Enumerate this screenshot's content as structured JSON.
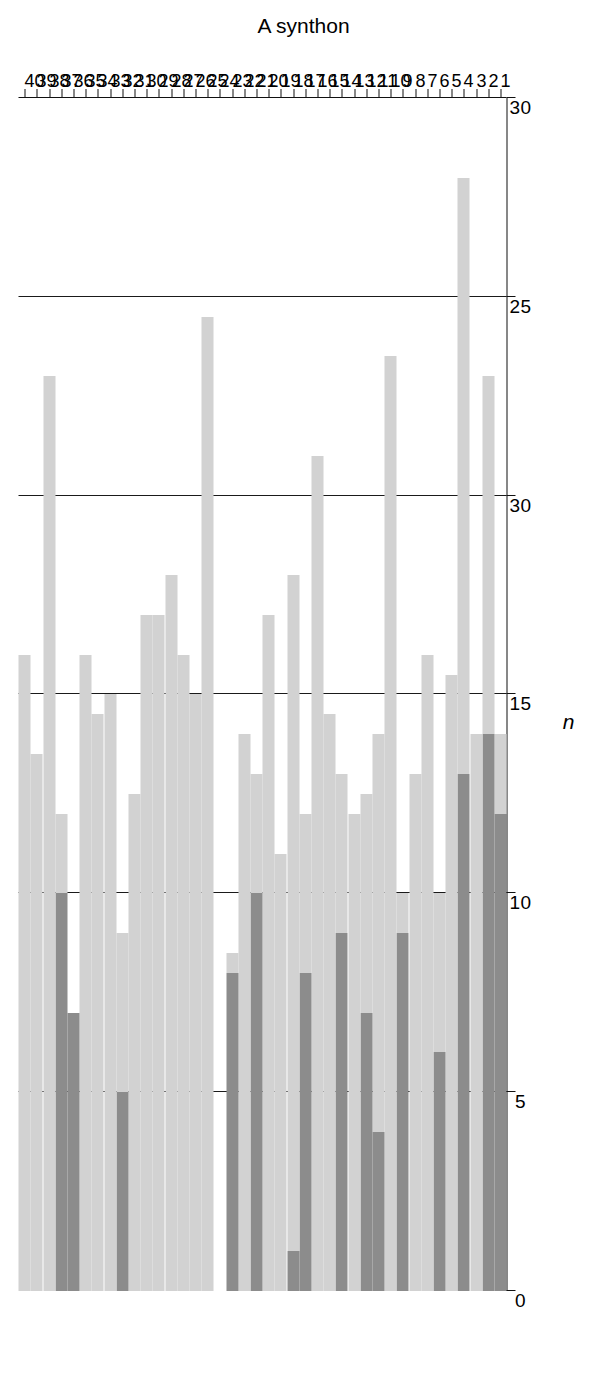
{
  "chart": {
    "value_axis": {
      "title": "n",
      "ticks": [
        {
          "value": 0,
          "label": "0"
        },
        {
          "value": 5,
          "label": "5"
        },
        {
          "value": 10,
          "label": "10"
        },
        {
          "value": 15,
          "label": "15"
        },
        {
          "value": 20,
          "label": "30"
        },
        {
          "value": 25,
          "label": "25"
        },
        {
          "value": 30,
          "label": "30"
        }
      ],
      "min": 0,
      "max": 30,
      "gridlines": [
        5,
        10,
        15,
        20,
        25,
        30
      ]
    },
    "category_axis": {
      "title": "A synthon",
      "categories": [
        "1",
        "2",
        "3",
        "4",
        "5",
        "6",
        "7",
        "8",
        "9",
        "10",
        "11",
        "12",
        "13",
        "14",
        "15",
        "16",
        "17",
        "18",
        "19",
        "20",
        "21",
        "22",
        "23",
        "24",
        "25",
        "26",
        "27",
        "28",
        "29",
        "30",
        "31",
        "32",
        "33",
        "34",
        "35",
        "36",
        "37",
        "38",
        "39",
        "40"
      ]
    },
    "colors": {
      "dark_segment": "#8c8c8c",
      "light_segment": "#d2d2d2",
      "axis": "#111111",
      "background": "#ffffff"
    }
  },
  "chart_data": {
    "type": "bar",
    "orientation": "horizontal-rotated",
    "stacked": true,
    "title": "",
    "xlabel": "A synthon",
    "ylabel": "n",
    "ylim": [
      0,
      30
    ],
    "grid": true,
    "legend": "none",
    "categories": [
      "1",
      "2",
      "3",
      "4",
      "5",
      "6",
      "7",
      "8",
      "9",
      "10",
      "11",
      "12",
      "13",
      "14",
      "15",
      "16",
      "17",
      "18",
      "19",
      "20",
      "21",
      "22",
      "23",
      "24",
      "25",
      "26",
      "27",
      "28",
      "29",
      "30",
      "31",
      "32",
      "33",
      "34",
      "35",
      "36",
      "37",
      "38",
      "39",
      "40"
    ],
    "series": [
      {
        "name": "dark segment",
        "color": "#8c8c8c",
        "values": [
          12,
          14,
          0,
          13,
          0,
          6,
          0,
          0,
          9,
          0,
          4,
          7,
          0,
          9,
          0,
          0,
          8,
          1,
          0,
          0,
          10,
          0,
          8,
          0,
          0,
          0,
          0,
          0,
          0,
          0,
          0,
          5,
          0,
          0,
          0,
          7,
          10,
          0,
          0,
          0
        ]
      },
      {
        "name": "light segment",
        "color": "#d2d2d2",
        "values": [
          2,
          9,
          14,
          15,
          15.5,
          4,
          16,
          13,
          1,
          23.5,
          10,
          5.5,
          12,
          4,
          14.5,
          21,
          4,
          17,
          11,
          4,
          3,
          14,
          0.5,
          0,
          24.5,
          15,
          0,
          0,
          0,
          0,
          0,
          4,
          0,
          0,
          0,
          0,
          2,
          0,
          0,
          0
        ]
      }
    ],
    "totals": [
      14,
      23,
      14,
      28,
      15.5,
      10,
      16,
      13,
      10,
      23.5,
      14,
      12.5,
      12,
      13,
      14.5,
      21,
      12,
      18,
      11,
      17,
      13,
      14,
      8.5,
      0,
      24.5,
      15,
      16,
      18,
      17,
      17,
      12.5,
      9,
      15,
      14.5,
      16,
      7,
      12,
      23,
      13.5,
      16
    ],
    "bars": [
      {
        "category": "1",
        "dark": 12,
        "light_end": 14
      },
      {
        "category": "2",
        "dark": 14,
        "light_end": 23
      },
      {
        "category": "3",
        "dark": 0,
        "light_end": 14
      },
      {
        "category": "4",
        "dark": 13,
        "light_end": 28
      },
      {
        "category": "5",
        "dark": 0,
        "light_end": 15.5
      },
      {
        "category": "6",
        "dark": 6,
        "light_end": 10
      },
      {
        "category": "7",
        "dark": 0,
        "light_end": 16
      },
      {
        "category": "8",
        "dark": 0,
        "light_end": 13
      },
      {
        "category": "9",
        "dark": 9,
        "light_end": 10
      },
      {
        "category": "10",
        "dark": 0,
        "light_end": 23.5
      },
      {
        "category": "11",
        "dark": 4,
        "light_end": 14
      },
      {
        "category": "12",
        "dark": 7,
        "light_end": 12.5
      },
      {
        "category": "13",
        "dark": 0,
        "light_end": 12
      },
      {
        "category": "14",
        "dark": 9,
        "light_end": 13
      },
      {
        "category": "15",
        "dark": 0,
        "light_end": 14.5
      },
      {
        "category": "16",
        "dark": 0,
        "light_end": 21
      },
      {
        "category": "17",
        "dark": 8,
        "light_end": 12
      },
      {
        "category": "18",
        "dark": 1,
        "light_end": 18
      },
      {
        "category": "19",
        "dark": 0,
        "light_end": 11
      },
      {
        "category": "20",
        "dark": 0,
        "light_end": 17
      },
      {
        "category": "21",
        "dark": 10,
        "light_end": 13
      },
      {
        "category": "22",
        "dark": 0,
        "light_end": 14
      },
      {
        "category": "23",
        "dark": 8,
        "light_end": 8.5
      },
      {
        "category": "24",
        "dark": 0,
        "light_end": 0
      },
      {
        "category": "25",
        "dark": 0,
        "light_end": 24.5
      },
      {
        "category": "26",
        "dark": 0,
        "light_end": 15
      },
      {
        "category": "27",
        "dark": 0,
        "light_end": 16
      },
      {
        "category": "28",
        "dark": 0,
        "light_end": 18
      },
      {
        "category": "29",
        "dark": 0,
        "light_end": 17
      },
      {
        "category": "30",
        "dark": 0,
        "light_end": 17
      },
      {
        "category": "31",
        "dark": 0,
        "light_end": 12.5
      },
      {
        "category": "32",
        "dark": 5,
        "light_end": 9
      },
      {
        "category": "33",
        "dark": 0,
        "light_end": 15
      },
      {
        "category": "34",
        "dark": 0,
        "light_end": 14.5
      },
      {
        "category": "35",
        "dark": 0,
        "light_end": 16
      },
      {
        "category": "36",
        "dark": 7,
        "light_end": 7
      },
      {
        "category": "37",
        "dark": 10,
        "light_end": 12
      },
      {
        "category": "38",
        "dark": 0,
        "light_end": 23
      },
      {
        "category": "39",
        "dark": 0,
        "light_end": 13.5
      },
      {
        "category": "40",
        "dark": 0,
        "light_end": 16
      }
    ]
  }
}
